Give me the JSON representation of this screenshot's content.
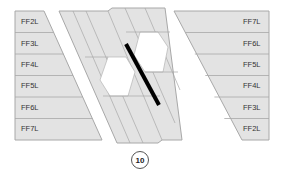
{
  "diagram": {
    "left_panel": {
      "labels": [
        "FF2L",
        "FF3L",
        "FF4L",
        "FF5L",
        "FF6L",
        "FF7L"
      ]
    },
    "right_panel": {
      "labels": [
        "FF7L",
        "FF6L",
        "FF5L",
        "FF4L",
        "FF3L",
        "FF2L"
      ]
    },
    "figure_number": "10",
    "colors": {
      "panel_fill": "#e3e3e3",
      "panel_stroke": "#a8a8a8",
      "highlight_fill": "#ffffff",
      "bar": "#000000"
    }
  }
}
